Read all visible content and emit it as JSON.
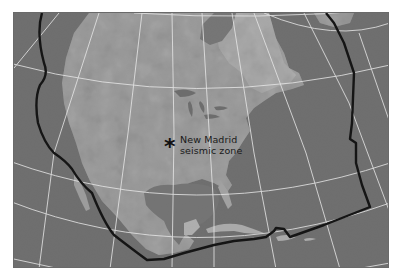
{
  "map": {
    "title": "North American plate boundary map",
    "style": "grayscale satellite relief with graticule",
    "colors": {
      "ocean": "#6e6e6e",
      "land_light": "#a8a8a8",
      "land_mid": "#8e8e8e",
      "graticule": "#e8e8e8",
      "plate_boundary": "#1a1a1a",
      "frame": "#6a6a6a"
    },
    "annotation": {
      "marker_icon": "asterisk",
      "marker_glyph": "*",
      "line1": "New Madrid",
      "line2": "seismic zone"
    },
    "features": [
      "graticule-lines",
      "plate-boundary-line",
      "north-america-landmass",
      "gulf-of-mexico",
      "great-lakes",
      "caribbean-islands"
    ]
  }
}
